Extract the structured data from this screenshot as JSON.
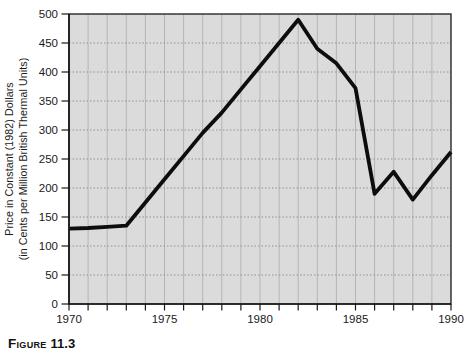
{
  "figure": {
    "caption_word": "Figure",
    "caption_number": "11.3"
  },
  "chart_data": {
    "type": "line",
    "title": "",
    "xlabel": "",
    "ylabel_line1": "Price in Constant (1982) Dollars",
    "ylabel_line2": "(in Cents per Million British Thermal Units)",
    "x": [
      1970,
      1971,
      1972,
      1973,
      1974,
      1975,
      1976,
      1977,
      1978,
      1979,
      1980,
      1981,
      1982,
      1983,
      1984,
      1985,
      1986,
      1987,
      1988,
      1989,
      1990
    ],
    "series": [
      {
        "name": "price-constant-1982-dollars",
        "values": [
          130,
          131,
          133,
          135,
          175,
          215,
          255,
          295,
          330,
          370,
          410,
          450,
          490,
          440,
          415,
          372,
          190,
          228,
          180,
          222,
          262
        ]
      }
    ],
    "xlim": [
      1970,
      1990
    ],
    "ylim": [
      0,
      500
    ],
    "ytick_step": 50,
    "ytick_labels": [
      "0",
      "50",
      "100",
      "150",
      "200",
      "250",
      "300",
      "350",
      "400",
      "450",
      "500"
    ],
    "xtick_minor_step": 1,
    "xtick_labels": [
      "1970",
      "1975",
      "1980",
      "1985",
      "1990"
    ],
    "xtick_label_years": [
      1970,
      1975,
      1980,
      1985,
      1990
    ],
    "grid": "on",
    "legend": "none",
    "colors": {
      "line": "#0d0d0d",
      "plot_bg": "#dbdbdb",
      "grid_vertical": "#b5b5b5",
      "grid_horizontal": "#909090",
      "frame": "#1a1a1a",
      "tick": "#1a1a1a",
      "text": "#1a1a1a"
    }
  }
}
